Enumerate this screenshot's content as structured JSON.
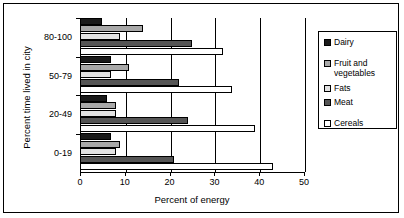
{
  "chart_data": {
    "type": "bar",
    "orientation": "horizontal",
    "title": "",
    "xlabel": "Percent of energy",
    "ylabel": "Percent time lived in city",
    "categories": [
      "0-19",
      "20-49",
      "50-79",
      "80-100"
    ],
    "xlim": [
      0,
      50
    ],
    "xticks": [
      0,
      10,
      20,
      30,
      40,
      50
    ],
    "grid": true,
    "legend_position": "right",
    "series": [
      {
        "name": "Dairy",
        "color": "#1a1a1a",
        "values": [
          7,
          6,
          7,
          5
        ]
      },
      {
        "name": "Fruit and vegetables",
        "color": "#a8a8a8",
        "values": [
          9,
          8,
          11,
          14
        ]
      },
      {
        "name": "Fats",
        "color": "#e2e2e2",
        "values": [
          8,
          8,
          7,
          9
        ]
      },
      {
        "name": "Meat",
        "color": "#555555",
        "values": [
          21,
          24,
          22,
          25
        ]
      },
      {
        "name": "Cereals",
        "color": "#ffffff",
        "values": [
          43,
          39,
          34,
          32
        ]
      }
    ]
  },
  "legend": {
    "entries": [
      {
        "label": "Dairy"
      },
      {
        "label": "Fruit and vegetables"
      },
      {
        "label": "Fats"
      },
      {
        "label": "Meat"
      },
      {
        "label": "Cereals"
      }
    ]
  }
}
